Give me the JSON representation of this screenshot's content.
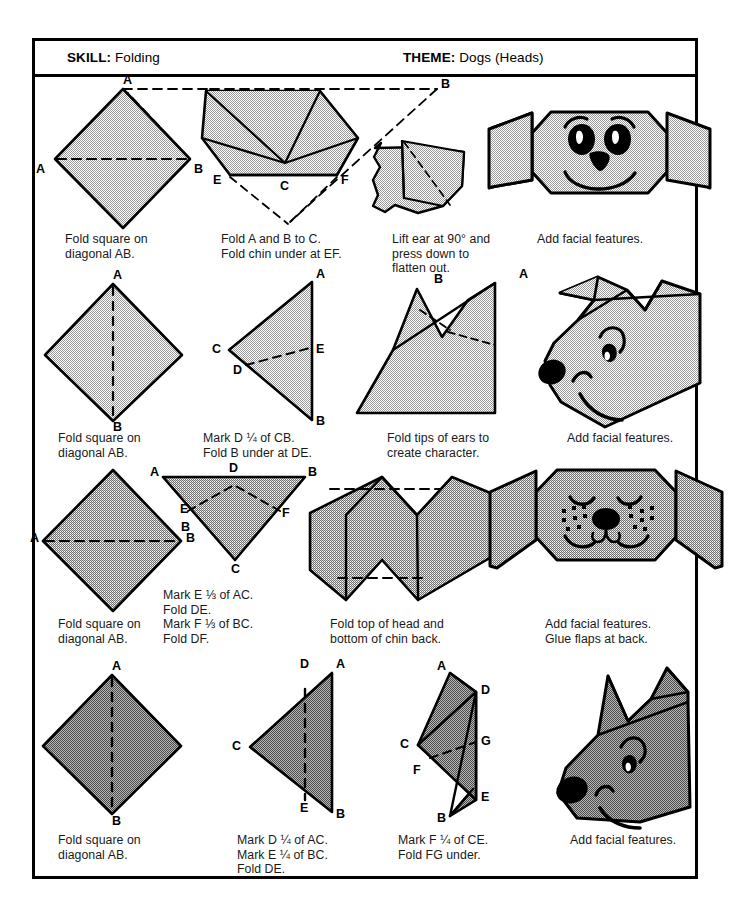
{
  "header": {
    "skill_key": "SKILL:",
    "skill_value": "Folding",
    "theme_key": "THEME:",
    "theme_value": "Dogs (Heads)"
  },
  "colors": {
    "ink": "#000000",
    "paper": "#ffffff",
    "fill_light": "#d4d4d4",
    "fill_medium": "#bdbdbd",
    "fill_dark": "#8f8f8f",
    "caption_text": "#1a1a1a"
  },
  "rows": [
    {
      "id": "row-1-floppy-ear-dog",
      "steps": [
        {
          "caption": "Fold square on\ndiagonal AB.",
          "labels": [
            "A",
            "A",
            "B"
          ]
        },
        {
          "caption": "Fold A and B to C.\nFold chin under at EF.",
          "labels": [
            "E",
            "C",
            "F",
            "B"
          ]
        },
        {
          "caption": "Lift ear at 90° and\npress down to\nflatten out.",
          "labels": []
        },
        {
          "caption": "Add facial features.",
          "labels": []
        }
      ]
    },
    {
      "id": "row-2-pointed-ear-dog",
      "steps": [
        {
          "caption": "Fold square on\ndiagonal AB.",
          "labels": [
            "A",
            "B"
          ]
        },
        {
          "caption": "Mark D ¼ of CB.\nFold B under at DE.",
          "labels": [
            "A",
            "C",
            "E",
            "D",
            "B"
          ]
        },
        {
          "caption": "Fold tips of ears to\ncreate character.",
          "labels": [
            "B",
            "A"
          ]
        },
        {
          "caption": "Add facial features.",
          "labels": []
        }
      ]
    },
    {
      "id": "row-3-spotted-dog",
      "steps": [
        {
          "caption": "Fold square on\ndiagonal AB.",
          "labels": [
            "A",
            "B"
          ]
        },
        {
          "caption": "Mark E ⅓ of AC.\nFold DE.\nMark F ⅓ of BC.\nFold DF.",
          "labels": [
            "A",
            "D",
            "B",
            "E",
            "B",
            "F",
            "C"
          ]
        },
        {
          "caption": "Fold top of head and\nbottom of chin back.",
          "labels": []
        },
        {
          "caption": "Add facial features.\nGlue flaps at back.",
          "labels": []
        }
      ]
    },
    {
      "id": "row-4-wolf-dog",
      "steps": [
        {
          "caption": "Fold square on\ndiagonal AB.",
          "labels": [
            "A",
            "B"
          ]
        },
        {
          "caption": "Mark D ¼ of AC.\nMark E ¼ of BC.\nFold DE.",
          "labels": [
            "D",
            "A",
            "C",
            "E",
            "B"
          ]
        },
        {
          "caption": "Mark F ¼ of CE.\nFold FG under.",
          "labels": [
            "A",
            "D",
            "C",
            "G",
            "F",
            "E",
            "B"
          ]
        },
        {
          "caption": "Add facial features.",
          "labels": []
        }
      ]
    }
  ],
  "point_labels": {
    "r1s1_a_top": "A",
    "r1s1_a_left": "A",
    "r1s1_b_right": "B",
    "r1s2_b_top": "B",
    "r1s2_e": "E",
    "r1s2_c": "C",
    "r1s2_f": "F",
    "r2s1_a": "A",
    "r2s1_b": "B",
    "r2s2_a": "A",
    "r2s2_c": "C",
    "r2s2_e": "E",
    "r2s2_d": "D",
    "r2s2_b": "B",
    "r2s3_b": "B",
    "r2s3_a": "A",
    "r3s1_a": "A",
    "r3s1_b": "B",
    "r3s2_a": "A",
    "r3s2_d": "D",
    "r3s2_b_top": "B",
    "r3s2_e": "E",
    "r3s2_b_low": "B",
    "r3s2_f": "F",
    "r3s2_c": "C",
    "r4s1_a": "A",
    "r4s1_b": "B",
    "r4s2_d": "D",
    "r4s2_a": "A",
    "r4s2_c": "C",
    "r4s2_e": "E",
    "r4s2_b": "B",
    "r4s3_a": "A",
    "r4s3_d": "D",
    "r4s3_c": "C",
    "r4s3_g": "G",
    "r4s3_f": "F",
    "r4s3_e": "E",
    "r4s3_b": "B"
  }
}
